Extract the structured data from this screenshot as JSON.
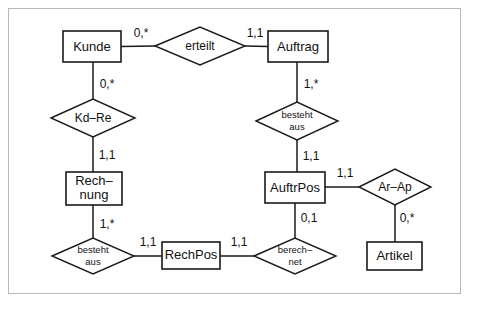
{
  "diagram": {
    "type": "entity-relationship-diagram",
    "notation": "min-max",
    "border_color": "#b8b8b8",
    "line_color": "#1a1a1a",
    "background": "#ffffff",
    "entities": [
      {
        "id": "kunde",
        "label": "Kunde",
        "lines": [
          "Kunde"
        ],
        "x": 63,
        "y": 31,
        "w": 58,
        "h": 31
      },
      {
        "id": "auftrag",
        "label": "Auftrag",
        "lines": [
          "Auftrag"
        ],
        "x": 268,
        "y": 31,
        "w": 60,
        "h": 31
      },
      {
        "id": "rechnung",
        "label": "Rechnung",
        "lines": [
          "Rech–",
          "nung"
        ],
        "x": 66,
        "y": 172,
        "w": 56,
        "h": 33
      },
      {
        "id": "auftrpos",
        "label": "AuftrPos",
        "lines": [
          "AuftrPos"
        ],
        "x": 265,
        "y": 172,
        "w": 60,
        "h": 31
      },
      {
        "id": "rechpos",
        "label": "RechPos",
        "lines": [
          "RechPos"
        ],
        "x": 162,
        "y": 242,
        "w": 58,
        "h": 27
      },
      {
        "id": "artikel",
        "label": "Artikel",
        "lines": [
          "Artikel"
        ],
        "x": 367,
        "y": 242,
        "w": 55,
        "h": 28
      }
    ],
    "relationships": [
      {
        "id": "erteilt",
        "label": "erteilt",
        "lines": [
          "erteilt"
        ],
        "cx": 200,
        "cy": 46,
        "rx": 45,
        "ry": 19,
        "size": "big"
      },
      {
        "id": "kd-re",
        "label": "Kd-Re",
        "lines": [
          "Kd–Re"
        ],
        "cx": 93,
        "cy": 118,
        "rx": 42,
        "ry": 19,
        "size": "big"
      },
      {
        "id": "besteht-aus-1",
        "label": "besteht aus",
        "lines": [
          "besteht",
          "aus"
        ],
        "cx": 297,
        "cy": 121,
        "rx": 41,
        "ry": 19,
        "size": "small"
      },
      {
        "id": "besteht-aus-2",
        "label": "besteht aus",
        "lines": [
          "besteht",
          "aus"
        ],
        "cx": 93,
        "cy": 256,
        "rx": 41,
        "ry": 18,
        "size": "small"
      },
      {
        "id": "berechnet",
        "label": "berech-net",
        "lines": [
          "berech–",
          "net"
        ],
        "cx": 295,
        "cy": 256,
        "rx": 41,
        "ry": 18,
        "size": "small"
      },
      {
        "id": "ar-ap",
        "label": "Ar-Ap",
        "lines": [
          "Ar–Ap"
        ],
        "cx": 395,
        "cy": 187,
        "rx": 36,
        "ry": 18,
        "size": "big"
      }
    ],
    "connections": [
      {
        "id": "kunde-erteilt",
        "from": "kunde",
        "to": "erteilt",
        "cardinality": "0,*",
        "label_x": 141,
        "label_y": 33
      },
      {
        "id": "erteilt-auftrag",
        "from": "erteilt",
        "to": "auftrag",
        "cardinality": "1,1",
        "label_x": 254,
        "label_y": 33
      },
      {
        "id": "kunde-kdre",
        "from": "kunde",
        "to": "kd-re",
        "cardinality": "0,*",
        "label_x": 106,
        "label_y": 85
      },
      {
        "id": "kdre-rechnung",
        "from": "kd-re",
        "to": "rechnung",
        "cardinality": "1,1",
        "label_x": 106,
        "label_y": 156
      },
      {
        "id": "auftrag-besteht",
        "from": "auftrag",
        "to": "besteht-aus-1",
        "cardinality": "1,*",
        "label_x": 310,
        "label_y": 85
      },
      {
        "id": "besteht-auftrpos",
        "from": "besteht-aus-1",
        "to": "auftrpos",
        "cardinality": "1,1",
        "label_x": 310,
        "label_y": 157
      },
      {
        "id": "rechnung-besteht2",
        "from": "rechnung",
        "to": "besteht-aus-2",
        "cardinality": "1,*",
        "label_x": 106,
        "label_y": 224
      },
      {
        "id": "besteht2-rechpos",
        "from": "besteht-aus-2",
        "to": "rechpos",
        "cardinality": "1,1",
        "label_x": 147,
        "label_y": 243
      },
      {
        "id": "rechpos-berechnet",
        "from": "rechpos",
        "to": "berechnet",
        "cardinality": "1,1",
        "label_x": 239,
        "label_y": 243
      },
      {
        "id": "auftrpos-berechnet",
        "from": "auftrpos",
        "to": "berechnet",
        "cardinality": "0,1",
        "label_x": 308,
        "label_y": 219
      },
      {
        "id": "auftrpos-arap",
        "from": "auftrpos",
        "to": "ar-ap",
        "cardinality": "1,1",
        "label_x": 344,
        "label_y": 174
      },
      {
        "id": "arap-artikel",
        "from": "ar-ap",
        "to": "artikel",
        "cardinality": "0,*",
        "label_x": 406,
        "label_y": 219
      }
    ]
  }
}
